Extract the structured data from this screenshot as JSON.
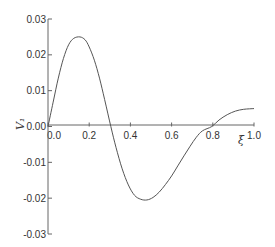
{
  "chart_data": {
    "type": "line",
    "title": "",
    "xlabel": "ξ",
    "ylabel": "V₁",
    "xlim": [
      0.0,
      1.0
    ],
    "ylim": [
      -0.03,
      0.03
    ],
    "grid": false,
    "legend": null,
    "x_ticks": [
      "0.0",
      "0.2",
      "0.4",
      "0.6",
      "0.8",
      "1.0"
    ],
    "y_ticks": [
      "0.03",
      "0.02",
      "0.01",
      "0.00",
      "-0.01",
      "-0.02",
      "-0.03"
    ],
    "series": [
      {
        "name": "V1",
        "x": [
          0.0,
          0.025,
          0.05,
          0.075,
          0.1,
          0.125,
          0.155,
          0.18,
          0.2,
          0.225,
          0.25,
          0.275,
          0.305,
          0.33,
          0.36,
          0.39,
          0.42,
          0.45,
          0.48,
          0.51,
          0.54,
          0.57,
          0.6,
          0.63,
          0.66,
          0.69,
          0.72,
          0.75,
          0.795,
          0.83,
          0.87,
          0.91,
          0.95,
          1.0
        ],
        "y": [
          0.0,
          0.0068,
          0.0135,
          0.019,
          0.0228,
          0.0246,
          0.025,
          0.0242,
          0.0222,
          0.0185,
          0.0135,
          0.0075,
          0.0,
          -0.0058,
          -0.0118,
          -0.0163,
          -0.0192,
          -0.0203,
          -0.0205,
          -0.0198,
          -0.0183,
          -0.0162,
          -0.0138,
          -0.011,
          -0.0082,
          -0.0055,
          -0.003,
          -0.0012,
          0.0,
          0.0018,
          0.0033,
          0.0043,
          0.0048,
          0.005
        ]
      }
    ]
  }
}
